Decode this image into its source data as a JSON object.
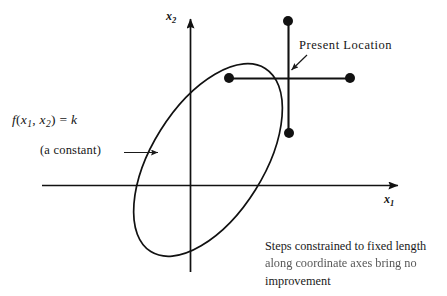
{
  "figure": {
    "background_color": "#ffffff",
    "ink_color": "#111111"
  },
  "axes": {
    "x_axis": {
      "label_main": "x",
      "label_sub": "1",
      "name": "x1",
      "orientation": "horizontal",
      "arrow": "right"
    },
    "y_axis": {
      "label_main": "x",
      "label_sub": "2",
      "name": "x2",
      "orientation": "vertical",
      "arrow": "up"
    }
  },
  "annotations": {
    "formula": {
      "f": "f",
      "open_paren": "(",
      "var1": "x",
      "var1_sub": "1",
      "comma": ", ",
      "var2": "x",
      "var2_sub": "2",
      "close_paren": ")",
      "equals": " = ",
      "value": "k",
      "plain_text": "f(x1, x2) = k"
    },
    "constant_note": "(a constant)",
    "constant_arrow": "⟶",
    "present_location": "Present Location",
    "caption": {
      "line_1": "Steps constrained to fixed length",
      "line_2": "along coordinate axes bring no",
      "line_3": "improvement",
      "full_text": "Steps constrained to fixed length along coordinate axes bring no improvement"
    }
  },
  "contour": {
    "type": "ellipse",
    "description": "Tilted ellipse level set f(x1,x2) = k",
    "center": {
      "x": 208,
      "y": 160
    },
    "semi_major": 108,
    "semi_minor": 56,
    "rotation_deg": -58
  },
  "step_cross": {
    "description": "Plus-shaped set of fixed-length steps along coordinate axes from the present location",
    "center": {
      "x": 288,
      "y": 78
    },
    "arm_length_px": 62,
    "points": [
      {
        "name": "step-up",
        "x": 288,
        "y": 21
      },
      {
        "name": "step-left",
        "x": 229,
        "y": 78
      },
      {
        "name": "step-right",
        "x": 350,
        "y": 78
      },
      {
        "name": "step-down",
        "x": 289,
        "y": 133
      }
    ],
    "dot_radius": 5
  },
  "pointer": {
    "name": "present-location-arrow",
    "from": {
      "x": 306,
      "y": 56
    },
    "to": {
      "x": 291,
      "y": 70
    }
  },
  "colors": {
    "ink": "#111111",
    "caption_ink": "#1a1a1a",
    "faded_ink": "#4a4a4a",
    "paper": "#ffffff"
  }
}
